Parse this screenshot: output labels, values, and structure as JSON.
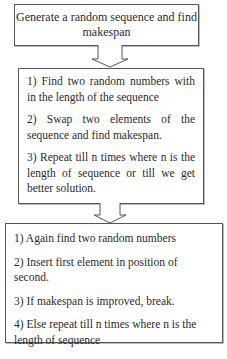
{
  "diagram": {
    "type": "flowchart",
    "boxes": [
      {
        "id": "start",
        "text": "Generate a random sequence and find makespan"
      },
      {
        "id": "swap-phase",
        "steps": [
          "1) Find two random  numbers with in the length of the sequence",
          "2)  Swap  two  elements  of  the sequence and find     makespan.",
          "3) Repeat till n times where n is the length of sequence or till we get better solution."
        ]
      },
      {
        "id": "insert-phase",
        "steps": [
          "1) Again find two random numbers",
          "2) Insert first element in position of second.",
          "3) If makespan is improved, break.",
          "4) Else repeat till n times where n is the length of sequence"
        ]
      }
    ],
    "edges": [
      {
        "from": "start",
        "to": "swap-phase",
        "icon": "down-arrow-icon"
      },
      {
        "from": "swap-phase",
        "to": "insert-phase",
        "icon": "down-arrow-icon"
      }
    ],
    "colors": {
      "border": "#555555",
      "text": "#2a2a2a",
      "background": "#ffffff"
    }
  }
}
